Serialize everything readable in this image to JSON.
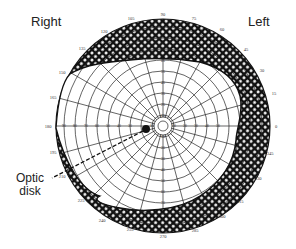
{
  "diagram": {
    "labels": {
      "right_eye": "Right",
      "left_eye": "Left",
      "optic_disk_line1": "Optic",
      "optic_disk_line2": "disk"
    },
    "colors": {
      "ink": "#1a1a1a",
      "hatch_fill": "#111111",
      "background": "#ffffff"
    },
    "perimetry_chart": {
      "angle_labels": [
        "0",
        "15",
        "30",
        "45",
        "60",
        "75",
        "90",
        "105",
        "120",
        "135",
        "150",
        "165",
        "180",
        "195",
        "210",
        "225",
        "240",
        "255",
        "270",
        "285",
        "300",
        "315",
        "330",
        "345"
      ],
      "radial_ticks": [
        "10",
        "20",
        "30",
        "40",
        "50",
        "60",
        "70",
        "80",
        "90"
      ],
      "shaded_region": "visual field defect / blind region between outer boundary and field limit",
      "optic_disk_marker": "filled dot left of center"
    }
  }
}
